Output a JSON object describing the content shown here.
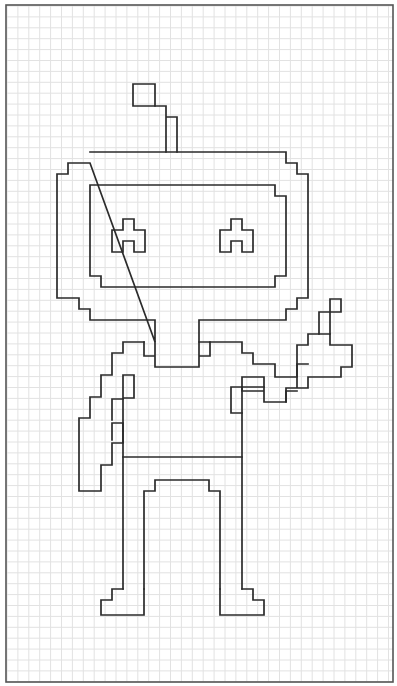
{
  "page": {
    "width": 397,
    "height": 686,
    "background": "#ffffff",
    "frame": {
      "x": 6,
      "y": 5,
      "w": 387,
      "h": 677,
      "color": "#555555"
    },
    "grid": {
      "x0": 7,
      "y0": 6,
      "pitch": 10.9,
      "color": "#e2e2e2"
    },
    "stroke_color": "#2b2b2b"
  },
  "drawing": {
    "subject": "pixel-art robot waving",
    "parts": [
      {
        "name": "antenna-tip",
        "d": "M133,84 H155 V106 H133 Z"
      },
      {
        "name": "antenna-stem",
        "d": "M155,106 H166 V117 H177 V152 M166,117 V152"
      },
      {
        "name": "head-outer",
        "d": "M90,152 H286 V163 H297 V174 H308 V298 H297 V309 H286 V320 H199 V342 M155,342 V320 H90 V309 H79 V298 H57 V174 H68 V163 H90 Z"
      },
      {
        "name": "face-inner",
        "d": "M90,185 H275 V196 H286 V276 H275 V287 H101 V276 H90 Z"
      },
      {
        "name": "left-eye",
        "d": "M123,219 H134 V230 H145 V252 H134 V241 H123 V252 H112 V230 H123 Z"
      },
      {
        "name": "right-eye",
        "d": "M231,219 H242 V230 H253 V252 H242 V241 H231 V252 H220 V230 H231 Z"
      },
      {
        "name": "neck",
        "d": "M155,342 V367 H199 V342 M144,342 V356 H155 M199,356 H210 V342 H199"
      },
      {
        "name": "left-shoulder-arm",
        "d": "M144,342 H123 V353 H112 V375 H101 V397 H90 V418 H79 V491 H101 V465 H112 V443 H123 V423 H112 V440 M134,375 H123 V399 H112 V420 M134,375 V398 H123"
      },
      {
        "name": "body-left",
        "d": "M123,399 V589"
      },
      {
        "name": "body-right",
        "d": "M242,387 V589"
      },
      {
        "name": "waist-line",
        "d": "M123,457 H242"
      },
      {
        "name": "right-shoulder-arm",
        "d": "M210,342 H242 V353 H253 V364 H275 V377 H297 V364 H308"
      },
      {
        "name": "hand",
        "d": "M297,388 V345 H308 V334 H330 V345 H352 V367 H341 V377 H308 V388 H286 V402 H264 V391 H242 V377 H264 V391"
      },
      {
        "name": "thumb",
        "d": "M319,334 V312 H330 V299 H341 V312 H330 V334"
      },
      {
        "name": "arm-link",
        "d": "M231,387 V413 H242 M231,387 H264 M286,402 V391 H297"
      },
      {
        "name": "leg-inner",
        "d": "M144,589 V491 H155 V480 H209 V491 H220 V589"
      },
      {
        "name": "left-foot",
        "d": "M123,589 H112 V600 H101 V615 H144 V589"
      },
      {
        "name": "right-foot",
        "d": "M220,589 V615 H264 V600 H253 V589 H242"
      }
    ]
  }
}
